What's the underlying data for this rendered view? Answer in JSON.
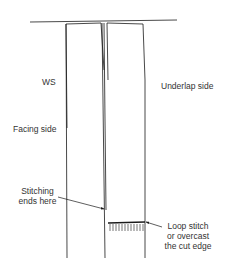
{
  "diagram": {
    "labels": {
      "ws": "WS",
      "underlap": "Underlap side",
      "facing": "Facing side",
      "stitching_line1": "Stitching",
      "stitching_line2": "ends here",
      "loop_line1": "Loop stitch",
      "loop_line2": "or overcast",
      "loop_line3": "the cut edge"
    },
    "colors": {
      "line": "#1a1a1a",
      "text": "#333333",
      "background": "#ffffff"
    }
  }
}
